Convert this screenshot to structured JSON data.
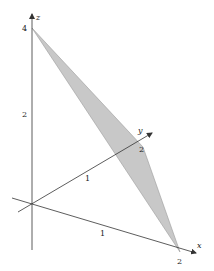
{
  "diagram": {
    "type": "3d-plane-triangle",
    "axes": {
      "x": {
        "label": "x",
        "ticks": [
          {
            "value": "1"
          },
          {
            "value": "2"
          }
        ]
      },
      "y": {
        "label": "y",
        "ticks": [
          {
            "value": "1"
          },
          {
            "value": "2"
          }
        ]
      },
      "z": {
        "label": "z",
        "ticks": [
          {
            "value": "2"
          },
          {
            "value": "4"
          }
        ]
      }
    },
    "triangle": {
      "vertices": [
        [
          2,
          0,
          0
        ],
        [
          0,
          2,
          0
        ],
        [
          0,
          0,
          4
        ]
      ],
      "fill": "#c8c8c8",
      "stroke": "#9a9a9a"
    },
    "colors": {
      "axis": "#333333",
      "background": "#ffffff"
    }
  }
}
